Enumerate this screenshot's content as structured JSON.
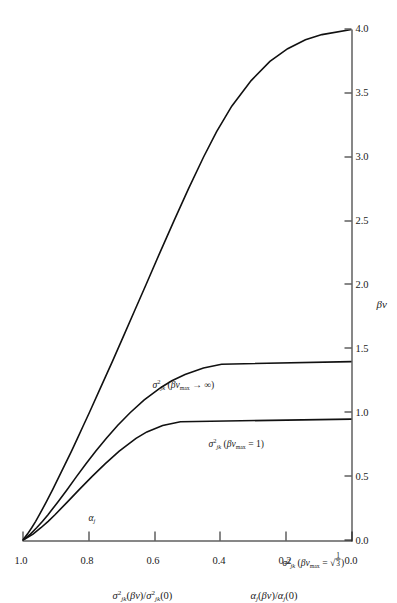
{
  "figure": {
    "orientation_deg": -90,
    "background": "#ffffff",
    "ink": "#111111"
  },
  "axes": {
    "x": {
      "title": "βv",
      "min": 0.0,
      "max": 4.0,
      "ticks": [
        "0.0",
        "0.5",
        "1.0",
        "1.5",
        "2.0",
        "2.5",
        "3.0",
        "3.5",
        "4.0"
      ],
      "tick_values": [
        0.0,
        0.5,
        1.0,
        1.5,
        2.0,
        2.5,
        3.0,
        3.5,
        4.0
      ]
    },
    "y": {
      "title_1": "σ²jk(βv)/σ²jk(0)",
      "title_2": "αj(βv)/αj(0)",
      "min": 0.0,
      "max": 1.0,
      "ticks": [
        "0.0",
        "0.2",
        "0.4",
        "0.6",
        "0.8",
        "1.0"
      ],
      "tick_values": [
        0.0,
        0.2,
        0.4,
        0.6,
        0.8,
        1.0
      ]
    }
  },
  "curve_labels": {
    "infinity": "σ²jk(βvmax → ∞)",
    "one": "σ²jk(βvmax = 1)",
    "root_third": "σ²jk(βvmax = √(1/3))",
    "alpha": "αj"
  },
  "chart_data": {
    "type": "line",
    "title": "",
    "xlabel": "βv",
    "ylabel": "σ²jk(βv)/σ²jk(0)   αj(βv)/αj(0)",
    "xlim": [
      0.0,
      4.0
    ],
    "ylim": [
      0.0,
      1.0
    ],
    "grid": false,
    "legend": "inline-curve-labels",
    "xticks": [
      0.0,
      0.5,
      1.0,
      1.5,
      2.0,
      2.5,
      3.0,
      3.5,
      4.0
    ],
    "yticks": [
      0.0,
      0.2,
      0.4,
      0.6,
      0.8,
      1.0
    ],
    "series": [
      {
        "name": "σ²jk(βvmax → ∞)",
        "x": [
          0.0,
          0.05,
          0.1,
          0.15,
          0.2,
          0.3,
          0.4,
          0.5,
          0.6,
          0.7,
          0.8,
          0.9,
          1.0,
          1.2,
          1.4,
          1.6,
          1.8,
          2.0,
          2.25,
          2.5,
          2.75,
          3.0,
          3.2,
          3.4,
          3.6,
          3.75,
          3.85,
          3.92,
          3.96,
          4.0
        ],
        "y": [
          1.0,
          0.985,
          0.972,
          0.96,
          0.949,
          0.928,
          0.908,
          0.889,
          0.87,
          0.851,
          0.833,
          0.815,
          0.797,
          0.762,
          0.727,
          0.693,
          0.659,
          0.625,
          0.583,
          0.54,
          0.496,
          0.45,
          0.41,
          0.364,
          0.305,
          0.248,
          0.194,
          0.14,
          0.09,
          0.0
        ]
      },
      {
        "name": "σ²jk(βvmax = 1)",
        "x": [
          0.0,
          0.05,
          0.1,
          0.15,
          0.2,
          0.3,
          0.4,
          0.5,
          0.6,
          0.7,
          0.8,
          0.9,
          1.0,
          1.1,
          1.2,
          1.25,
          1.3,
          1.35,
          1.38,
          1.4
        ],
        "y": [
          1.0,
          0.976,
          0.957,
          0.939,
          0.923,
          0.893,
          0.864,
          0.836,
          0.807,
          0.777,
          0.745,
          0.711,
          0.673,
          0.63,
          0.578,
          0.546,
          0.506,
          0.45,
          0.395,
          0.0
        ]
      },
      {
        "name": "σ²jk(βvmax = √(1/3))",
        "x": [
          0.0,
          0.05,
          0.1,
          0.15,
          0.2,
          0.3,
          0.4,
          0.5,
          0.6,
          0.7,
          0.8,
          0.85,
          0.9,
          0.93,
          0.95
        ],
        "y": [
          1.0,
          0.968,
          0.944,
          0.922,
          0.902,
          0.864,
          0.827,
          0.789,
          0.749,
          0.706,
          0.655,
          0.622,
          0.574,
          0.52,
          0.0
        ]
      },
      {
        "name": "αj",
        "note": "label attached to the uppermost (βvmax → ∞) branch region near βv ≈ 0.75"
      }
    ]
  }
}
